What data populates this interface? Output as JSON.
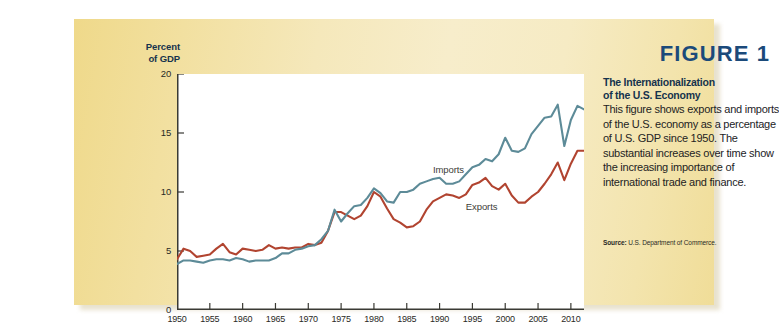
{
  "figure": {
    "number_label": "FIGURE 1",
    "heading_line1": "The Internationalization",
    "heading_line2": "of the U.S. Economy",
    "body": "This figure shows exports and imports of the U.S. economy as a percentage of U.S. GDP since 1950. The substantial increases over time show the increasing importance of international trade and finance.",
    "source_lead": "Source:",
    "source_text": "U.S. Department of Commerce."
  },
  "axis": {
    "y_title_line1": "Percent",
    "y_title_line2": "of GDP",
    "y_ticks": [
      "0",
      "5",
      "10",
      "15",
      "20"
    ],
    "x_ticks": [
      "1950",
      "1955",
      "1960",
      "1965",
      "1970",
      "1975",
      "1980",
      "1985",
      "1990",
      "1995",
      "2000",
      "2005",
      "2010"
    ]
  },
  "colors": {
    "imports_line": "#5d8b98",
    "exports_line": "#b14430",
    "panel_cream": "#f5e8bb",
    "figure_number_navy": "#1b4a7a",
    "heading_navy": "#16334d",
    "plot_background": "#ffffff"
  },
  "chart_data": {
    "type": "line",
    "title": "The Internationalization of the U.S. Economy",
    "xlabel": "",
    "ylabel": "Percent of GDP",
    "xlim": [
      1950,
      2012
    ],
    "ylim": [
      0,
      20
    ],
    "grid": false,
    "legend": "inline-annotations",
    "annotations": [
      {
        "text": "Imports",
        "year": 1989,
        "value": 11.9
      },
      {
        "text": "Exports",
        "year": 1994,
        "value": 8.7
      }
    ],
    "x": [
      1950,
      1951,
      1952,
      1953,
      1954,
      1955,
      1956,
      1957,
      1958,
      1959,
      1960,
      1961,
      1962,
      1963,
      1964,
      1965,
      1966,
      1967,
      1968,
      1969,
      1970,
      1971,
      1972,
      1973,
      1974,
      1975,
      1976,
      1977,
      1978,
      1979,
      1980,
      1981,
      1982,
      1983,
      1984,
      1985,
      1986,
      1987,
      1988,
      1989,
      1990,
      1991,
      1992,
      1993,
      1994,
      1995,
      1996,
      1997,
      1998,
      1999,
      2000,
      2001,
      2002,
      2003,
      2004,
      2005,
      2006,
      2007,
      2008,
      2009,
      2010,
      2011,
      2012
    ],
    "series": [
      {
        "name": "Exports",
        "color": "#b14430",
        "values": [
          4.3,
          5.2,
          5.0,
          4.5,
          4.6,
          4.7,
          5.2,
          5.6,
          4.9,
          4.7,
          5.2,
          5.1,
          5.0,
          5.1,
          5.5,
          5.2,
          5.3,
          5.2,
          5.3,
          5.3,
          5.6,
          5.5,
          5.7,
          6.7,
          8.3,
          8.3,
          8.0,
          7.7,
          8.0,
          8.8,
          10.0,
          9.6,
          8.6,
          7.7,
          7.4,
          7.0,
          7.1,
          7.5,
          8.5,
          9.2,
          9.5,
          9.8,
          9.7,
          9.5,
          9.8,
          10.6,
          10.8,
          11.2,
          10.5,
          10.2,
          10.7,
          9.7,
          9.1,
          9.1,
          9.6,
          10.0,
          10.7,
          11.5,
          12.5,
          11.0,
          12.4,
          13.5,
          13.5
        ]
      },
      {
        "name": "Imports",
        "color": "#5d8b98",
        "values": [
          3.9,
          4.2,
          4.2,
          4.1,
          4.0,
          4.2,
          4.3,
          4.3,
          4.2,
          4.4,
          4.3,
          4.1,
          4.2,
          4.2,
          4.2,
          4.4,
          4.8,
          4.8,
          5.1,
          5.2,
          5.4,
          5.5,
          6.0,
          6.7,
          8.5,
          7.5,
          8.2,
          8.8,
          8.9,
          9.5,
          10.3,
          9.9,
          9.2,
          9.1,
          10.0,
          10.0,
          10.2,
          10.7,
          10.9,
          11.1,
          11.2,
          10.7,
          10.7,
          10.9,
          11.5,
          12.1,
          12.3,
          12.8,
          12.6,
          13.2,
          14.6,
          13.5,
          13.4,
          13.7,
          14.9,
          15.6,
          16.3,
          16.4,
          17.4,
          13.9,
          16.1,
          17.3,
          17.0
        ]
      }
    ]
  }
}
